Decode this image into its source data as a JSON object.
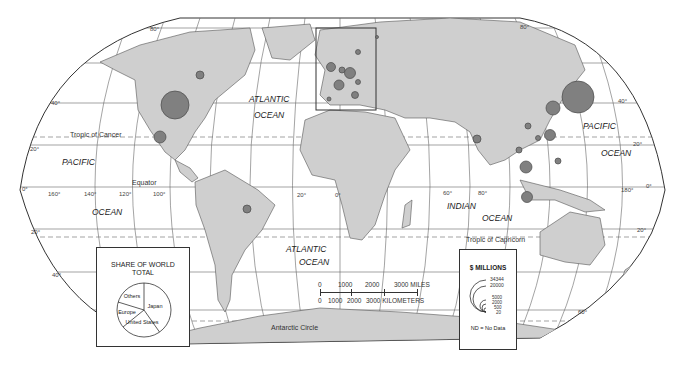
{
  "map": {
    "projection": "world-oval",
    "colors": {
      "land": "#cfcfcf",
      "land_outline": "#555555",
      "ocean": "#ffffff",
      "graticule": "#666666",
      "circle_fill": "#808080",
      "circle_outline": "#4a4a4a"
    },
    "ocean_labels": [
      {
        "text": "ATLANTIC",
        "x": 249,
        "y": 95
      },
      {
        "text": "OCEAN",
        "x": 254,
        "y": 111
      },
      {
        "text": "PACIFIC",
        "x": 62,
        "y": 158
      },
      {
        "text": "OCEAN",
        "x": 92,
        "y": 208
      },
      {
        "text": "PACIFIC",
        "x": 583,
        "y": 122
      },
      {
        "text": "OCEAN",
        "x": 601,
        "y": 149
      },
      {
        "text": "ATLANTIC",
        "x": 286,
        "y": 245
      },
      {
        "text": "OCEAN",
        "x": 299,
        "y": 258
      },
      {
        "text": "INDIAN",
        "x": 447,
        "y": 202
      },
      {
        "text": "OCEAN",
        "x": 482,
        "y": 214
      }
    ],
    "line_labels": [
      {
        "text": "Tropic of Cancer",
        "x": 70,
        "y": 131
      },
      {
        "text": "Equator",
        "x": 132,
        "y": 179
      },
      {
        "text": "Tropic of Capricorn",
        "x": 466,
        "y": 236
      },
      {
        "text": "Antarctic Circle",
        "x": 271,
        "y": 324
      }
    ],
    "degree_labels": [
      {
        "text": "80°",
        "x": 150,
        "y": 26
      },
      {
        "text": "80°",
        "x": 520,
        "y": 24
      },
      {
        "text": "40°",
        "x": 51,
        "y": 100
      },
      {
        "text": "40°",
        "x": 618,
        "y": 98
      },
      {
        "text": "20°",
        "x": 30,
        "y": 146
      },
      {
        "text": "20°",
        "x": 633,
        "y": 141
      },
      {
        "text": "0°",
        "x": 22,
        "y": 186
      },
      {
        "text": "0°",
        "x": 646,
        "y": 183
      },
      {
        "text": "160°",
        "x": 48,
        "y": 191
      },
      {
        "text": "140°",
        "x": 84,
        "y": 191
      },
      {
        "text": "120°",
        "x": 119,
        "y": 191
      },
      {
        "text": "100°",
        "x": 153,
        "y": 191
      },
      {
        "text": "180°",
        "x": 621,
        "y": 187
      },
      {
        "text": "20°",
        "x": 31,
        "y": 229
      },
      {
        "text": "20°",
        "x": 637,
        "y": 227
      },
      {
        "text": "40°",
        "x": 52,
        "y": 272
      },
      {
        "text": "60°",
        "x": 578,
        "y": 309
      },
      {
        "text": "20°",
        "x": 297,
        "y": 192
      },
      {
        "text": "0°",
        "x": 335,
        "y": 192
      },
      {
        "text": "60°",
        "x": 443,
        "y": 190
      },
      {
        "text": "80°",
        "x": 478,
        "y": 190
      }
    ],
    "circles": [
      {
        "region": "United States",
        "x": 175,
        "y": 105,
        "r": 14
      },
      {
        "region": "Canada",
        "x": 200,
        "y": 75,
        "r": 4
      },
      {
        "region": "Mexico",
        "x": 160,
        "y": 137,
        "r": 6
      },
      {
        "region": "Brazil",
        "x": 247,
        "y": 209,
        "r": 4
      },
      {
        "region": "United Kingdom",
        "x": 331,
        "y": 67,
        "r": 4.5
      },
      {
        "region": "Germany",
        "x": 350,
        "y": 73,
        "r": 5.5
      },
      {
        "region": "France",
        "x": 339,
        "y": 85,
        "r": 5
      },
      {
        "region": "Netherlands/Belgium",
        "x": 342,
        "y": 70,
        "r": 3
      },
      {
        "region": "Italy",
        "x": 355,
        "y": 95,
        "r": 3.5
      },
      {
        "region": "Spain",
        "x": 329,
        "y": 99,
        "r": 2
      },
      {
        "region": "Sweden",
        "x": 358,
        "y": 52,
        "r": 2.5
      },
      {
        "region": "Finland",
        "x": 377,
        "y": 37,
        "r": 1.5
      },
      {
        "region": "Austria/Switzerland",
        "x": 358,
        "y": 82,
        "r": 2.5
      },
      {
        "region": "Japan",
        "x": 578,
        "y": 97,
        "r": 16
      },
      {
        "region": "South Korea",
        "x": 553,
        "y": 108,
        "r": 7
      },
      {
        "region": "China",
        "x": 528,
        "y": 126,
        "r": 3
      },
      {
        "region": "Taiwan",
        "x": 550,
        "y": 135,
        "r": 5.5
      },
      {
        "region": "Hong Kong",
        "x": 538,
        "y": 138,
        "r": 2.5
      },
      {
        "region": "India",
        "x": 477,
        "y": 139,
        "r": 4
      },
      {
        "region": "Thailand",
        "x": 519,
        "y": 150,
        "r": 3
      },
      {
        "region": "Philippines",
        "x": 558,
        "y": 161,
        "r": 3
      },
      {
        "region": "Malaysia/Singapore",
        "x": 526,
        "y": 167,
        "r": 6
      },
      {
        "region": "Indonesia",
        "x": 527,
        "y": 197,
        "r": 5.5
      }
    ],
    "inset_frame": {
      "x": 316,
      "y": 28,
      "w": 60,
      "h": 82
    }
  },
  "scale_bar": {
    "miles_ticks": [
      "0",
      "1000",
      "2000",
      "3000 MILES"
    ],
    "km_ticks": [
      "0",
      "1000",
      "2000",
      "3000 KILOMETERS"
    ]
  },
  "pie_box": {
    "title_line1": "SHARE OF WORLD",
    "title_line2": "TOTAL",
    "slices": [
      {
        "label": "Japan",
        "percent": 40
      },
      {
        "label": "United States",
        "percent": 27
      },
      {
        "label": "Europe",
        "percent": 11
      },
      {
        "label": "Others",
        "percent": 22
      }
    ]
  },
  "legend_box": {
    "title": "$ MILLIONS",
    "values": [
      "34344",
      "20000",
      "5000",
      "2000",
      "500",
      "20"
    ],
    "note": "ND = No Data"
  }
}
